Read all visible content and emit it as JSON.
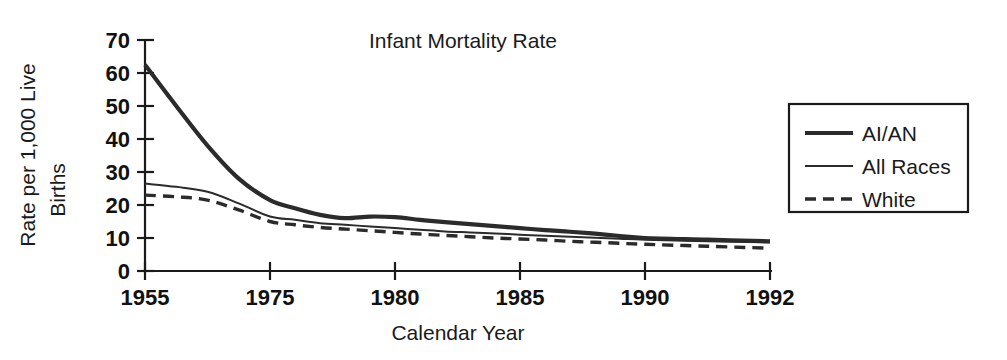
{
  "chart_data": {
    "type": "line",
    "title": "Infant Mortality Rate",
    "xlabel": "Calendar Year",
    "ylabel": "Rate per 1,000 Live Births",
    "ylabel_line1": "Rate per 1,000 Live",
    "ylabel_line2": "Births",
    "grid": false,
    "legend_position": "right",
    "ylim": [
      0,
      70
    ],
    "yticks": [
      0,
      10,
      20,
      30,
      40,
      50,
      60,
      70
    ],
    "ytick_labels": [
      "0",
      "10",
      "20",
      "30",
      "40",
      "50",
      "60",
      "70"
    ],
    "xtick_labels": [
      "1955",
      "1975",
      "1980",
      "1985",
      "1990",
      "1992"
    ],
    "xtick_positions": [
      1955,
      1975,
      1980,
      1985,
      1990,
      1992
    ],
    "x_axis_note": "tick positions are evenly spaced on the plot despite unequal year intervals",
    "x": [
      1955,
      1960,
      1965,
      1970,
      1975,
      1976,
      1977,
      1978,
      1979,
      1980,
      1981,
      1982,
      1983,
      1984,
      1985,
      1986,
      1987,
      1988,
      1989,
      1990,
      1991,
      1992
    ],
    "series": [
      {
        "name": "AI/AN",
        "style": "thick-solid",
        "color": "#2b2b2b",
        "values": [
          62.5,
          50.0,
          38.0,
          28.0,
          21.5,
          19.0,
          17.0,
          16.0,
          16.5,
          16.3,
          15.5,
          14.8,
          14.2,
          13.6,
          13.0,
          12.4,
          11.9,
          11.3,
          10.6,
          10.0,
          9.5,
          9.0
        ]
      },
      {
        "name": "All Races",
        "style": "thin-solid",
        "color": "#2b2b2b",
        "values": [
          26.5,
          25.5,
          24.0,
          20.5,
          16.5,
          15.5,
          14.5,
          14.0,
          13.5,
          13.0,
          12.5,
          12.0,
          11.7,
          11.4,
          11.0,
          10.7,
          10.4,
          10.1,
          9.8,
          9.5,
          9.0,
          8.7
        ]
      },
      {
        "name": "White",
        "style": "dashed",
        "color": "#2b2b2b",
        "values": [
          23.0,
          22.5,
          21.5,
          18.5,
          15.0,
          14.0,
          13.2,
          12.7,
          12.2,
          11.7,
          11.2,
          10.8,
          10.4,
          10.0,
          9.7,
          9.4,
          9.0,
          8.7,
          8.4,
          8.1,
          7.5,
          6.9
        ]
      }
    ],
    "legend_entries": [
      {
        "label": "AI/AN",
        "style": "thick-solid"
      },
      {
        "label": "All Races",
        "style": "thin-solid"
      },
      {
        "label": "White",
        "style": "dashed"
      }
    ]
  }
}
